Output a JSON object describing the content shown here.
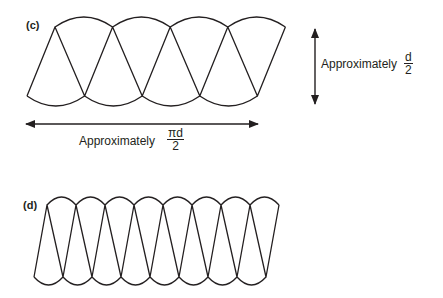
{
  "panels": [
    {
      "id": "c",
      "label": "(c)",
      "cones": 4
    },
    {
      "id": "d",
      "label": "(d)",
      "cones": 8
    }
  ],
  "annotations": {
    "height": {
      "prefix": "Approximately",
      "numerator": "d",
      "denominator": "2"
    },
    "width": {
      "prefix": "Approximately",
      "numerator": "πd",
      "denominator": "2"
    }
  },
  "colors": {
    "stroke": "#231f20",
    "background": "#ffffff"
  }
}
